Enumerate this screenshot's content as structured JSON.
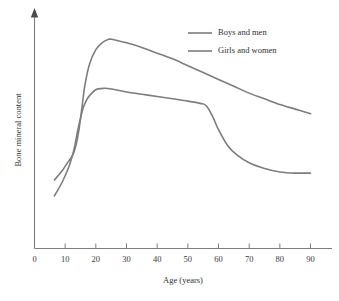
{
  "chart_data": {
    "type": "line",
    "title": "",
    "xlabel": "Age (years)",
    "ylabel": "Bone mineral content",
    "xlim": [
      0,
      97
    ],
    "ylim": [
      0,
      100
    ],
    "grid": false,
    "legend_position": "top-right",
    "xticks": [
      "0",
      "10",
      "20",
      "30",
      "40",
      "50",
      "60",
      "70",
      "80",
      "90"
    ],
    "xtick_values": [
      0,
      10,
      20,
      30,
      40,
      50,
      60,
      70,
      80,
      90
    ],
    "yticks": [],
    "series": [
      {
        "name": "Boys and men",
        "color": "#7d7d7d",
        "x": [
          6.5,
          9,
          11,
          12.5,
          13.5,
          14.5,
          15.5,
          16.5,
          18,
          20,
          22,
          24,
          25.5,
          30,
          35,
          40,
          45,
          50,
          55,
          60,
          65,
          70,
          75,
          80,
          85,
          90
        ],
        "y": [
          30,
          34,
          38,
          41,
          45,
          52,
          62,
          72,
          81,
          87,
          90,
          91.5,
          91.5,
          90,
          88,
          85.5,
          83,
          80,
          77,
          74,
          71,
          68,
          65.5,
          63,
          61,
          59
        ]
      },
      {
        "name": "Girls and women",
        "color": "#7d7d7d",
        "x": [
          6.5,
          9,
          11,
          12,
          13,
          14,
          15,
          16,
          17,
          18,
          20,
          22,
          24,
          30,
          35,
          40,
          45,
          50,
          54,
          56,
          58,
          60,
          63,
          66,
          70,
          75,
          80,
          85,
          90
        ],
        "y": [
          23,
          29,
          35,
          39,
          44,
          51,
          57,
          62,
          65,
          67,
          69.5,
          70,
          70,
          68.5,
          67.5,
          66.5,
          65.5,
          64.5,
          63.5,
          62.5,
          58,
          52,
          45,
          41,
          37.5,
          35,
          33.5,
          33,
          33
        ]
      }
    ]
  },
  "legend": {
    "items": [
      {
        "label": "Boys and men"
      },
      {
        "label": "Girls and women"
      }
    ]
  },
  "axes": {
    "x_title": "Age (years)",
    "y_title": "Bone mineral content"
  }
}
